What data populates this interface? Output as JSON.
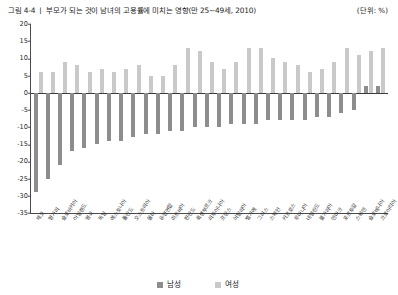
{
  "caption": {
    "text": "그림 4-4 ㅣ 부모가 되는 것이 남녀의 고용률에 미치는 영향(만 25~49세, 2010)",
    "unit": "(단위: %)"
  },
  "legend": {
    "male_label": "남성",
    "female_label": "여성",
    "male_color": "#8d8d8d",
    "female_color": "#c9c9c9"
  },
  "chart_data": {
    "type": "bar",
    "title": "그림 4-4 ㅣ 부모가 되는 것이 남녀의 고용률에 미치는 영향(만 25~49세, 2010)",
    "xlabel": "",
    "ylabel": "",
    "unit": "(단위: %)",
    "ylim": [
      -35,
      20
    ],
    "yticks": [
      20,
      15,
      10,
      5,
      0,
      -5,
      -10,
      -15,
      -20,
      -25,
      -30,
      -35
    ],
    "ytick_labels": [
      "20",
      "15",
      "10",
      "5",
      "0",
      "-5",
      "-10",
      "-15",
      "-20",
      "-25",
      "-30",
      "-35"
    ],
    "grid": false,
    "legend_position": "bottom",
    "categories": [
      "체코",
      "헝가리",
      "슬로바키아",
      "아일랜드",
      "영국",
      "독일",
      "에스토니아",
      "폴란드",
      "오스트리아",
      "몰타",
      "유럽연합",
      "라트비아",
      "핀란드",
      "룩셈부르크",
      "리투아니아",
      "프랑스",
      "이탈리아",
      "벨기에",
      "그리스",
      "스페인",
      "키프로스",
      "루마니아",
      "네덜란드",
      "불가리아",
      "덴마크",
      "포르투갈",
      "스웨덴",
      "슬로베니아",
      "크로아티아"
    ],
    "series": [
      {
        "name": "남성",
        "color": "#8d8d8d",
        "values": [
          -29,
          -25,
          -21,
          -17,
          -16,
          -15,
          -14,
          -14,
          -13,
          -12,
          -12,
          -11,
          -11,
          -10,
          -10,
          -10,
          -9,
          -9,
          -9,
          -8,
          -8,
          -8,
          -8,
          -7,
          -7,
          -6,
          -5,
          2,
          2
        ]
      },
      {
        "name": "여성",
        "color": "#c9c9c9",
        "values": [
          6,
          6,
          9,
          8,
          6,
          7,
          6,
          7,
          8,
          5,
          5,
          8,
          13,
          12,
          9,
          7,
          9,
          13,
          13,
          10,
          9,
          8,
          6,
          7,
          9,
          13,
          11,
          12,
          13
        ]
      }
    ]
  }
}
